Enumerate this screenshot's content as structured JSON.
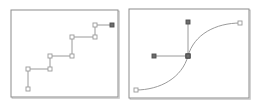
{
  "figure": {
    "background_color": "#ffffff",
    "panel_count": 2
  },
  "style": {
    "panel_border_color": "#8c8c8c",
    "panel_border_shadow_color": "#c9c9c9",
    "panel_fill_color": "#ffffff",
    "path_stroke_color": "#9a9a9a",
    "handle_line_color": "#9a9a9a",
    "node_open_fill": "#ffffff",
    "node_open_stroke": "#9a9a9a",
    "node_filled_fill": "#6e6e6e",
    "node_filled_stroke": "#4d4d4d",
    "path_stroke_width": "1",
    "node_size_px": "4"
  },
  "panels": [
    {
      "id": "left",
      "name": "step-path-panel",
      "label": "Step path panel",
      "viewbox": "0 0 110 90",
      "border_rect": {
        "x": 1,
        "y": 1,
        "width": 107,
        "height": 87
      },
      "path_d": "M 18 80 L 18 60 L 40 60 L 40 47 L 62 47 L 62 28 L 85 28 L 85 16 L 102 16",
      "path_type": "polyline-step",
      "vertices": [
        {
          "name": "node-start",
          "x": 18,
          "y": 80,
          "style": "open"
        },
        {
          "name": "node-corner-1",
          "x": 18,
          "y": 60,
          "style": "open"
        },
        {
          "name": "node-corner-2",
          "x": 40,
          "y": 60,
          "style": "open"
        },
        {
          "name": "node-corner-3",
          "x": 40,
          "y": 47,
          "style": "open"
        },
        {
          "name": "node-corner-4",
          "x": 62,
          "y": 47,
          "style": "open"
        },
        {
          "name": "node-corner-5",
          "x": 62,
          "y": 28,
          "style": "open"
        },
        {
          "name": "node-corner-6",
          "x": 85,
          "y": 28,
          "style": "open"
        },
        {
          "name": "node-corner-7",
          "x": 85,
          "y": 16,
          "style": "open"
        },
        {
          "name": "node-end",
          "x": 102,
          "y": 16,
          "style": "filled"
        }
      ]
    },
    {
      "id": "right",
      "name": "bezier-curve-panel",
      "label": "Bezier tangent handle panel",
      "viewbox": "0 0 123 92",
      "border_rect": {
        "x": 1,
        "y": 1,
        "width": 120,
        "height": 89
      },
      "curves": [
        {
          "name": "lower-left-curve",
          "d": "M 8 82 C 32 82 54 70 60 48",
          "start": {
            "x": 8,
            "y": 82,
            "style": "open"
          },
          "end": {
            "x": 60,
            "y": 48,
            "style": "filled"
          }
        },
        {
          "name": "upper-right-curve",
          "d": "M 60 48 C 66 26 88 15 112 15",
          "start": {
            "x": 60,
            "y": 48,
            "style": "filled"
          },
          "end": {
            "x": 112,
            "y": 15,
            "style": "open"
          }
        }
      ],
      "handles": [
        {
          "name": "horizontal-tangent-handle",
          "from": {
            "x": 60,
            "y": 48
          },
          "to": {
            "x": 26,
            "y": 48
          },
          "endpoint_style": "filled"
        },
        {
          "name": "vertical-tangent-handle",
          "from": {
            "x": 60,
            "y": 48
          },
          "to": {
            "x": 60,
            "y": 14
          },
          "endpoint_style": "filled"
        }
      ],
      "anchor_node": {
        "name": "center-anchor-node",
        "x": 60,
        "y": 48,
        "style": "filled"
      }
    }
  ]
}
